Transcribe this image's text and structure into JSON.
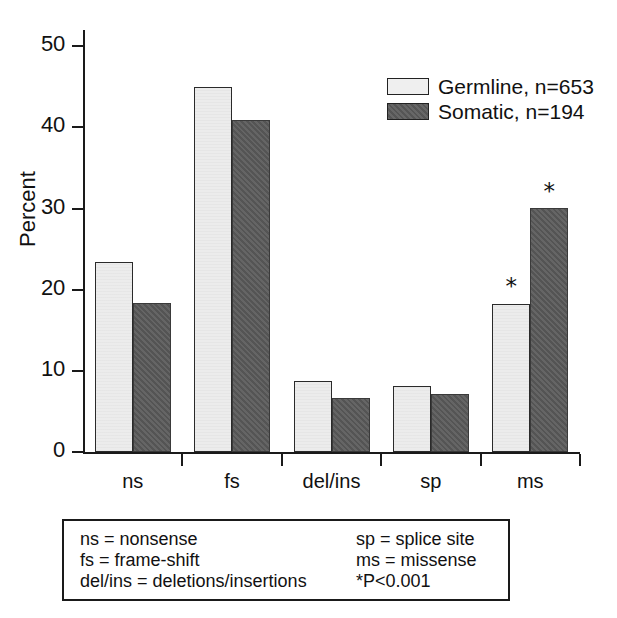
{
  "chart_data": {
    "type": "bar",
    "title": "",
    "xlabel": "",
    "ylabel": "Percent",
    "ylim": [
      0,
      52
    ],
    "yticks": [
      0,
      10,
      20,
      30,
      40,
      50
    ],
    "ytick_labels": [
      "0",
      "10",
      "20",
      "30",
      "40",
      "50"
    ],
    "grid": false,
    "legend_position": "upper right",
    "categories": [
      "ns",
      "fs",
      "del/ins",
      "sp",
      "ms"
    ],
    "series": [
      {
        "name": "Germline, n=653",
        "color": "#ececec",
        "values": [
          23.4,
          45.0,
          8.8,
          8.1,
          18.3
        ]
      },
      {
        "name": "Somatic, n=194",
        "color": "#595959",
        "values": [
          18.4,
          40.9,
          6.7,
          7.1,
          30.1
        ]
      }
    ],
    "annotations": [
      {
        "label": "*",
        "category": "ms",
        "series": "Germline, n=653"
      },
      {
        "label": "*",
        "category": "ms",
        "series": "Somatic, n=194"
      }
    ]
  },
  "axes": {
    "y_title": "Percent",
    "y_tick_labels": [
      "50",
      "40",
      "30",
      "20",
      "10",
      "0"
    ],
    "x_tick_labels": [
      "ns",
      "fs",
      "del/ins",
      "sp",
      "ms"
    ]
  },
  "legend": {
    "items": [
      {
        "label": "Germline, n=653",
        "swatch": "light-gray-swatch"
      },
      {
        "label": "Somatic, n=194",
        "swatch": "dark-gray-swatch"
      }
    ]
  },
  "key_box": {
    "left_column": [
      "ns = nonsense",
      "fs = frame-shift",
      "del/ins = deletions/insertions"
    ],
    "right_column": [
      "sp = splice site",
      "ms = missense",
      "*P<0.001"
    ]
  },
  "colors": {
    "germline_fill": "#ececec",
    "somatic_fill": "#595959",
    "axis": "#1a1a1a",
    "background": "#ffffff"
  }
}
